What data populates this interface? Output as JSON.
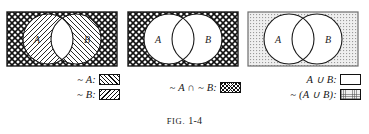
{
  "figure": {
    "caption_prefix": "FIG.",
    "caption_number": "1-4",
    "letters": {
      "a": "A",
      "b": "B"
    },
    "colors": {
      "ink": "#111111",
      "stipple_gray": "#f0f0f0",
      "paper": "#ffffff"
    }
  },
  "panels": [
    {
      "id": "panel-complement-a-and-complement-b-separate",
      "venn": {
        "outer_fill": "crosshatch",
        "a_only_fill": "hatch-back",
        "b_only_fill": "hatch-fwd",
        "intersection_fill": "blank",
        "label_a": "A",
        "label_b": "B"
      },
      "legend": [
        {
          "label": "~ A:",
          "swatch": "hatch-fwd",
          "name": "legend-not-a"
        },
        {
          "label": "~ B:",
          "swatch": "hatch-back",
          "name": "legend-not-b"
        }
      ]
    },
    {
      "id": "panel-intersection-of-complements",
      "venn": {
        "outer_fill": "crosshatch",
        "a_only_fill": "blank",
        "b_only_fill": "blank",
        "intersection_fill": "blank",
        "label_a": "A",
        "label_b": "B"
      },
      "legend": [
        {
          "label": "~ A ∩ ~ B:",
          "swatch": "crosshatch",
          "name": "legend-not-a-intersect-not-b"
        }
      ]
    },
    {
      "id": "panel-complement-of-union",
      "venn": {
        "outer_fill": "stipple",
        "a_only_fill": "blank",
        "b_only_fill": "blank",
        "intersection_fill": "blank",
        "label_a": "A",
        "label_b": "B"
      },
      "legend": [
        {
          "label": "A ∪ B:",
          "swatch": "blank",
          "name": "legend-a-union-b"
        },
        {
          "label": "~ (A ∪ B):",
          "swatch": "stipple",
          "name": "legend-not-a-union-b"
        }
      ]
    }
  ]
}
